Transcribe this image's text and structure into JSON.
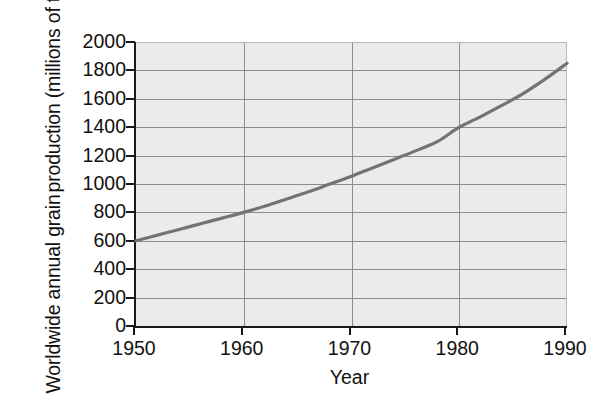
{
  "chart": {
    "y_axis_title_line1": "Worldwide annual grain",
    "y_axis_title_line2": "production (millions of tonnes)",
    "x_axis_title": "Year",
    "caption_sliver": "",
    "plot_background": "#ebebeb",
    "grid_color": "#8c8c8c",
    "axis_color": "#1a1a1a",
    "series_color": "#737373"
  },
  "chart_data": {
    "type": "line",
    "title": "",
    "subtitle": "",
    "xlabel": "Year",
    "ylabel": "Worldwide annual grain production (millions of tonnes)",
    "xlim": [
      1950,
      1990
    ],
    "ylim": [
      0,
      2000
    ],
    "xticks": [
      1950,
      1960,
      1970,
      1980,
      1990
    ],
    "xticklabels": [
      "1950",
      "1960",
      "1970",
      "1980",
      "1990"
    ],
    "yticks": [
      0,
      200,
      400,
      600,
      800,
      1000,
      1200,
      1400,
      1600,
      1800,
      2000
    ],
    "yticklabels": [
      "0",
      "200",
      "400",
      "600",
      "800",
      "1000",
      "1200",
      "1400",
      "1600",
      "1800",
      "2000"
    ],
    "grid": true,
    "grid_axis": "both",
    "legend": false,
    "legend_position": "none",
    "series": [
      {
        "name": "Worldwide annual grain production",
        "color": "#737373",
        "x": [
          1950,
          1952,
          1954,
          1956,
          1958,
          1960,
          1962,
          1964,
          1966,
          1968,
          1970,
          1972,
          1974,
          1976,
          1978,
          1980,
          1982,
          1984,
          1986,
          1988,
          1990
        ],
        "values": [
          600,
          640,
          680,
          720,
          760,
          800,
          845,
          895,
          945,
          1000,
          1055,
          1115,
          1175,
          1235,
          1300,
          1400,
          1475,
          1555,
          1640,
          1740,
          1850
        ]
      }
    ],
    "annotations": []
  }
}
